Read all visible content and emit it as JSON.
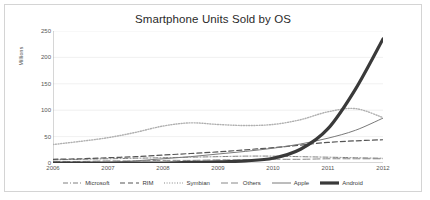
{
  "chart_data": {
    "type": "line",
    "title": "Smartphone Units Sold by OS",
    "xlabel": "",
    "ylabel": "Millions",
    "xlim": [
      2006,
      2012
    ],
    "ylim": [
      0,
      250
    ],
    "yticks": [
      0,
      50,
      100,
      150,
      200,
      250
    ],
    "xticks": [
      "2006",
      "2007",
      "2008",
      "2009",
      "2010",
      "2011",
      "2012"
    ],
    "grid": "horizontal",
    "legend_position": "bottom",
    "x": [
      2006,
      2006.5,
      2007,
      2007.5,
      2008,
      2008.5,
      2009,
      2009.5,
      2010,
      2010.5,
      2011,
      2011.5,
      2012
    ],
    "series": [
      {
        "name": "Microsoft",
        "style": "dash-dot",
        "color": "#808080",
        "width": 1,
        "values": [
          6,
          7,
          8,
          9,
          10,
          11,
          12,
          13,
          13,
          12,
          11,
          10,
          9
        ]
      },
      {
        "name": "RIM",
        "style": "dashed",
        "color": "#555555",
        "width": 1.2,
        "values": [
          7,
          8,
          10,
          12,
          15,
          18,
          21,
          25,
          29,
          34,
          39,
          42,
          44
        ]
      },
      {
        "name": "Symbian",
        "style": "dotted",
        "color": "#b0b0b0",
        "width": 1.4,
        "values": [
          35,
          41,
          48,
          58,
          70,
          76,
          73,
          71,
          73,
          82,
          97,
          103,
          86
        ]
      },
      {
        "name": "Others",
        "style": "long-dash",
        "color": "#888888",
        "width": 1,
        "values": [
          3,
          3,
          4,
          4,
          5,
          5,
          6,
          6,
          7,
          7,
          8,
          8,
          8
        ]
      },
      {
        "name": "Apple",
        "style": "solid",
        "color": "#7a7a7a",
        "width": 1,
        "values": [
          0,
          0,
          1,
          4,
          8,
          12,
          17,
          22,
          28,
          36,
          47,
          62,
          85
        ]
      },
      {
        "name": "Android",
        "style": "solid-thick",
        "color": "#3a3a3a",
        "width": 3.2,
        "values": [
          0,
          0,
          0,
          0,
          0,
          1,
          2,
          4,
          9,
          26,
          65,
          140,
          235
        ]
      }
    ],
    "series_end_note": ""
  },
  "legend": {
    "items": [
      {
        "label": "Microsoft"
      },
      {
        "label": "RIM"
      },
      {
        "label": "Symbian"
      },
      {
        "label": "Others"
      },
      {
        "label": "Apple"
      },
      {
        "label": "Android"
      }
    ]
  }
}
